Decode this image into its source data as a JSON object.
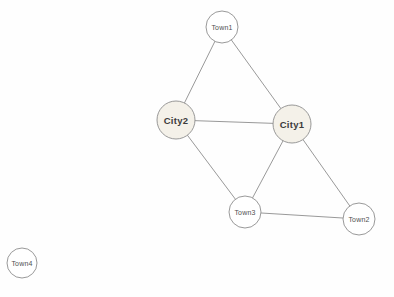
{
  "graph": {
    "type": "node-link-diagram",
    "background_color": "#fefefe",
    "edge_color": "#8d8d8d",
    "node_stroke_color": "#8d8d8d",
    "nodes": [
      {
        "id": "Town1",
        "label": "Town1",
        "kind": "town",
        "x": 222,
        "y": 27,
        "r": 16,
        "fill": "#ffffff"
      },
      {
        "id": "City2",
        "label": "City2",
        "kind": "city",
        "x": 176,
        "y": 120,
        "r": 19,
        "fill": "#f4f1e9"
      },
      {
        "id": "City1",
        "label": "City1",
        "kind": "city",
        "x": 292,
        "y": 124,
        "r": 19,
        "fill": "#f4f1e9"
      },
      {
        "id": "Town3",
        "label": "Town3",
        "kind": "town",
        "x": 245,
        "y": 212,
        "r": 16,
        "fill": "#ffffff"
      },
      {
        "id": "Town2",
        "label": "Town2",
        "kind": "town",
        "x": 359,
        "y": 219,
        "r": 16,
        "fill": "#ffffff"
      },
      {
        "id": "Town4",
        "label": "Town4",
        "kind": "town",
        "x": 22,
        "y": 263,
        "r": 15,
        "fill": "#ffffff"
      }
    ],
    "edges": [
      {
        "from": "Town1",
        "to": "City2"
      },
      {
        "from": "Town1",
        "to": "City1"
      },
      {
        "from": "City2",
        "to": "City1"
      },
      {
        "from": "City2",
        "to": "Town3"
      },
      {
        "from": "City1",
        "to": "Town3"
      },
      {
        "from": "City1",
        "to": "Town2"
      },
      {
        "from": "Town3",
        "to": "Town2"
      }
    ]
  }
}
